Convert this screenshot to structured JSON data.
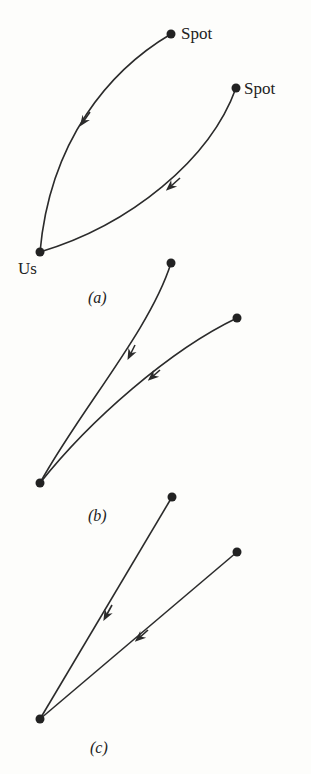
{
  "colors": {
    "ink": "#2b2b2b",
    "background": "#fdfdfb"
  },
  "panels": [
    {
      "id": "a",
      "caption": "(a)",
      "nodes": [
        {
          "label": "Spot"
        },
        {
          "label": "Spot"
        },
        {
          "label": "Us"
        }
      ],
      "description": "Two curved paths from distant spots converge at Us"
    },
    {
      "id": "b",
      "caption": "(b)",
      "description": "Paths from farther spots become nearly straight near Us"
    },
    {
      "id": "c",
      "caption": "(c)",
      "description": "Straight line paths from spots to Us"
    }
  ]
}
